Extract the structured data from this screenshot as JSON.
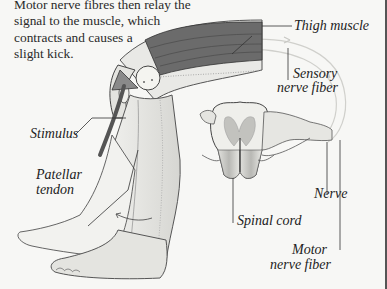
{
  "caption": {
    "lines": [
      "Motor nerve fibres then relay the",
      "signal to the muscle, which",
      "contracts and causes a",
      "slight kick."
    ]
  },
  "labels": {
    "thigh_muscle": "Thigh muscle",
    "sensory_nerve_fiber_line1": "Sensory",
    "sensory_nerve_fiber_line2": "nerve fiber",
    "stimulus": "Stimulus",
    "patellar_tendon_line1": "Patellar",
    "patellar_tendon_line2": "tendon",
    "nerve": "Nerve",
    "spinal_cord": "Spinal cord",
    "motor_nerve_fiber_line1": "Motor",
    "motor_nerve_fiber_line2": "nerve fiber"
  },
  "colors": {
    "background": "#f7f7f5",
    "ink": "#222222",
    "muscle": "#5a5a5a",
    "nerve_path": "#d0d0d0",
    "gray_matter": "#bdbdbd"
  }
}
